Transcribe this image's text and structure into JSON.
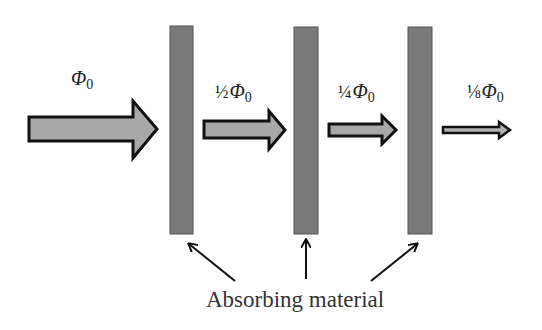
{
  "diagram": {
    "labels": {
      "flux_0": {
        "prefix": "",
        "symbol": "Φ",
        "subscript": "0"
      },
      "flux_1": {
        "prefix": "½",
        "symbol": "Φ",
        "subscript": "0"
      },
      "flux_2": {
        "prefix": "¼",
        "symbol": "Φ",
        "subscript": "0"
      },
      "flux_3": {
        "prefix": "⅛",
        "symbol": "Φ",
        "subscript": "0"
      }
    },
    "caption": "Absorbing material",
    "colors": {
      "arrow_fill": "#a8a8a8",
      "arrow_stroke": "#111111",
      "slab_fill": "#7a7a7a",
      "pointer": "#111111"
    },
    "arrows": [
      {
        "name": "incident-flux",
        "relative_intensity": 1
      },
      {
        "name": "flux-after-layer-1",
        "relative_intensity": 0.5
      },
      {
        "name": "flux-after-layer-2",
        "relative_intensity": 0.25
      },
      {
        "name": "flux-after-layer-3",
        "relative_intensity": 0.125
      }
    ],
    "slabs": [
      {
        "name": "absorber-1"
      },
      {
        "name": "absorber-2"
      },
      {
        "name": "absorber-3"
      }
    ]
  }
}
